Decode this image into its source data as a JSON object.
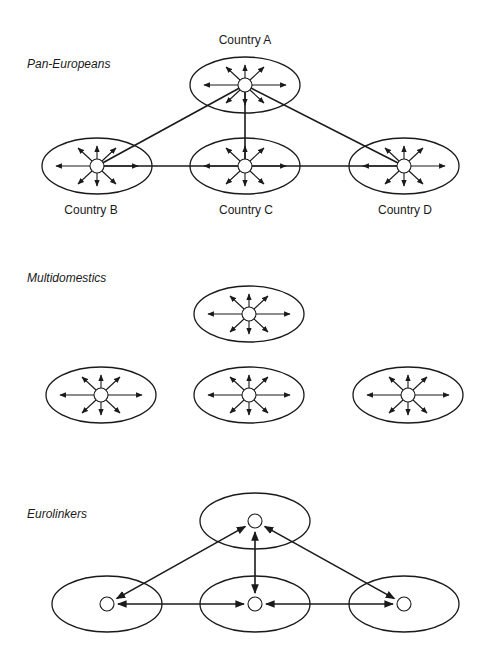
{
  "sections": [
    {
      "title": "Pan-Europeans",
      "title_pos": [
        27,
        68
      ],
      "countries": [
        {
          "label": "Country A",
          "cx": 245,
          "cy": 85,
          "label_pos": [
            245,
            44
          ]
        },
        {
          "label": "Country B",
          "cx": 97,
          "cy": 166,
          "label_pos": [
            91,
            214
          ]
        },
        {
          "label": "Country C",
          "cx": 245,
          "cy": 166,
          "label_pos": [
            246,
            214
          ]
        },
        {
          "label": "Country D",
          "cx": 404,
          "cy": 166,
          "label_pos": [
            405,
            214
          ]
        }
      ],
      "local_arrows": true,
      "links": [
        [
          0,
          1
        ],
        [
          0,
          2
        ],
        [
          0,
          3
        ],
        [
          1,
          3
        ]
      ],
      "link_style": "plain"
    },
    {
      "title": "Multidomestics",
      "title_pos": [
        27,
        282
      ],
      "countries": [
        {
          "label": "",
          "cx": 249,
          "cy": 314
        },
        {
          "label": "",
          "cx": 101,
          "cy": 395
        },
        {
          "label": "",
          "cx": 249,
          "cy": 395
        },
        {
          "label": "",
          "cx": 408,
          "cy": 395
        }
      ],
      "local_arrows": true,
      "links": [],
      "link_style": "none"
    },
    {
      "title": "Eurolinkers",
      "title_pos": [
        27,
        518
      ],
      "countries": [
        {
          "label": "",
          "cx": 255,
          "cy": 521
        },
        {
          "label": "",
          "cx": 107,
          "cy": 604
        },
        {
          "label": "",
          "cx": 255,
          "cy": 604
        },
        {
          "label": "",
          "cx": 404,
          "cy": 604
        }
      ],
      "local_arrows": false,
      "links": [
        [
          0,
          1
        ],
        [
          0,
          2
        ],
        [
          0,
          3
        ],
        [
          1,
          2
        ],
        [
          2,
          3
        ]
      ],
      "link_style": "double-arrow"
    }
  ]
}
